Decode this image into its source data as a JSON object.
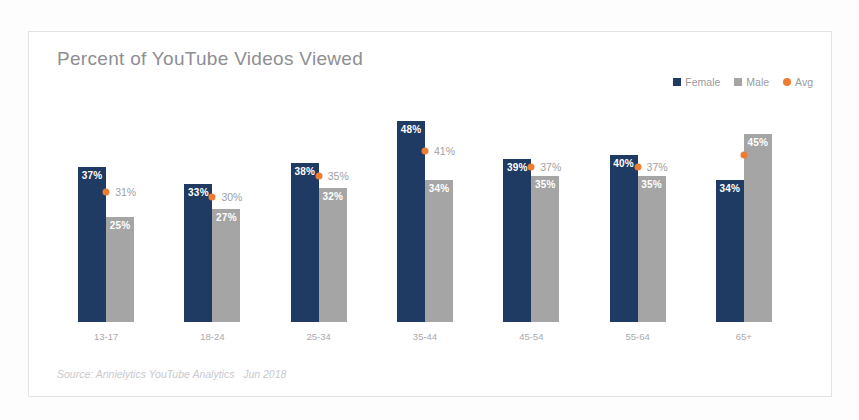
{
  "card": {
    "source_note": "Source: Annielytics YouTube Analytics   Jun 2018"
  },
  "legend": {
    "items": [
      {
        "label": "Female",
        "color": "#1f3b63",
        "marker": "square"
      },
      {
        "label": "Male",
        "color": "#a5a5a5",
        "marker": "square"
      },
      {
        "label": "Avg",
        "color": "#ed7d31",
        "marker": "dot"
      }
    ]
  },
  "chart_data": {
    "type": "bar",
    "title": "Percent of YouTube Videos Viewed",
    "xlabel": "",
    "ylabel": "",
    "ylim": [
      0,
      55
    ],
    "grid": false,
    "legend_position": "top-right",
    "value_suffix": "%",
    "categories": [
      "13-17",
      "18-24",
      "25-34",
      "35-44",
      "45-54",
      "55-64",
      "65+"
    ],
    "series": [
      {
        "name": "Female",
        "color": "#1f3b63",
        "values": [
          37,
          33,
          38,
          48,
          39,
          40,
          34
        ],
        "labels": [
          "37%",
          "33%",
          "38%",
          "48%",
          "39%",
          "40%",
          "34%"
        ]
      },
      {
        "name": "Male",
        "color": "#a5a5a5",
        "values": [
          25,
          27,
          32,
          34,
          35,
          35,
          45
        ],
        "labels": [
          "25%",
          "27%",
          "32%",
          "34%",
          "35%",
          "35%",
          "45%"
        ]
      },
      {
        "name": "Avg",
        "color": "#ed7d31",
        "type": "marker",
        "values": [
          31,
          30,
          35,
          41,
          37,
          37,
          40
        ],
        "labels": [
          "31%",
          "30%",
          "35%",
          "41%",
          "37%",
          "37%",
          "40%"
        ],
        "label_hidden": [
          false,
          false,
          false,
          false,
          false,
          false,
          true
        ]
      }
    ]
  }
}
